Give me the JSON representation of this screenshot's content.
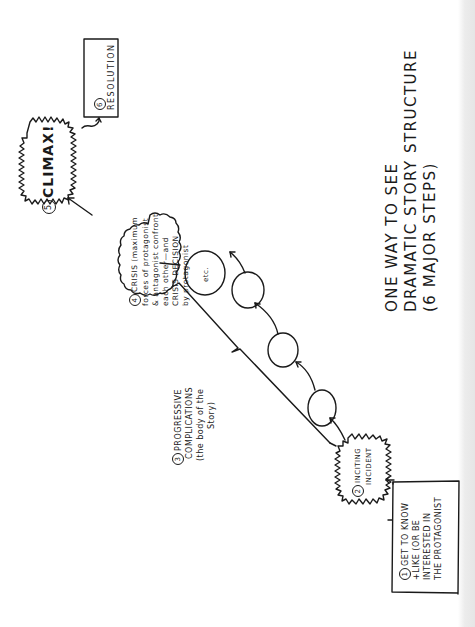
{
  "title": {
    "lines": [
      "ONE WAY TO SEE",
      "DRAMATIC STORY STRUCTURE",
      "(6 MAJOR STEPS)"
    ]
  },
  "steps": [
    {
      "number": "1",
      "lines": [
        "GET TO KNOW",
        "+LIKE (OR BE",
        "INTERESTED IN",
        "THE PROTAGONIST"
      ]
    },
    {
      "number": "2",
      "lines": [
        "INCITING",
        "INCIDENT"
      ]
    },
    {
      "number": "3",
      "lines": [
        "PROGRESSIVE",
        "COMPLICATIONS",
        "(the body of the",
        "Story)"
      ]
    },
    {
      "number": "4",
      "lines": [
        "CRISIS (maximum",
        "forces of protagonist",
        "& antagonist confront",
        "each other—and",
        "CRISIS DECISION",
        "by protagonist"
      ]
    },
    {
      "number": "5",
      "label": "CLIMAX!"
    },
    {
      "number": "6",
      "label": "RESOLUTION"
    }
  ],
  "complication_circles": {
    "count": 4,
    "last_label": "etc."
  },
  "colors": {
    "ink": "#1a1a1a",
    "paper": "#ffffff",
    "edge_shade": "#e6e6e6"
  }
}
